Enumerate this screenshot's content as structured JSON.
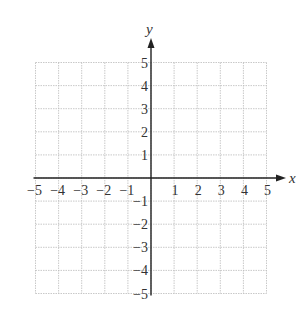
{
  "chart_data": {
    "type": "scatter",
    "title": "",
    "xlabel": "x",
    "ylabel": "y",
    "xlim": [
      -5,
      5
    ],
    "ylim": [
      -5,
      5
    ],
    "grid": true,
    "grid_style": "dotted",
    "x_ticks": [
      -5,
      -4,
      -3,
      -2,
      -1,
      1,
      2,
      3,
      4,
      5
    ],
    "y_ticks": [
      5,
      4,
      3,
      2,
      1,
      -1,
      -2,
      -3,
      -4,
      -5
    ],
    "x_tick_labels": [
      "−5",
      "−4",
      "−3",
      "−2",
      "−1",
      "1",
      "2",
      "3",
      "4",
      "5"
    ],
    "y_tick_labels": [
      "5",
      "4",
      "3",
      "2",
      "1",
      "−1",
      "−2",
      "−3",
      "−4",
      "−5"
    ],
    "series": [],
    "legend": null
  },
  "colors": {
    "axis": "#222222",
    "grid": "#bbbbbb",
    "text": "#333333"
  }
}
